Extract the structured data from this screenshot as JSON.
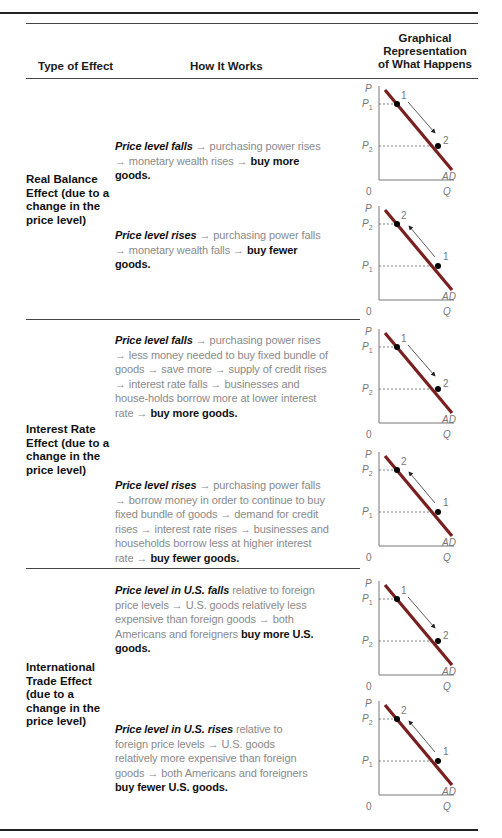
{
  "table": {
    "headers": {
      "type_of_effect": "Type of Effect",
      "how_it_works": "How It Works",
      "graphical_line1": "Graphical",
      "graphical_line2": "Representation",
      "graphical_line3": "of What Happens"
    },
    "rows": [
      {
        "effect": "Real Balance Effect (due to a change in the price level)",
        "cases": [
          {
            "lead": "Price level falls",
            "body": " → purchasing power rises → monetary wealth rises → ",
            "result": "buy more goods.",
            "direction": "down",
            "graph": {
              "y_axis": "P",
              "x_axis": "Q",
              "origin": "0",
              "curve": "AD",
              "upper_price": "P1",
              "lower_price": "P2",
              "start_point": "1",
              "end_point": "2"
            }
          },
          {
            "lead": "Price level rises",
            "body": " → purchasing power falls → monetary wealth falls → ",
            "result": "buy fewer goods.",
            "direction": "up",
            "graph": {
              "y_axis": "P",
              "x_axis": "Q",
              "origin": "0",
              "curve": "AD",
              "upper_price": "P2",
              "lower_price": "P1",
              "start_point": "1",
              "end_point": "2"
            }
          }
        ]
      },
      {
        "effect": "Interest Rate Effect (due to a change in the price level)",
        "cases": [
          {
            "lead": "Price level falls",
            "body": " → purchasing power rises → less money needed to buy fixed bundle of goods → save more → supply of credit rises → interest rate falls → businesses and house-holds borrow more at lower interest rate → ",
            "result": "buy more goods.",
            "direction": "down",
            "graph": {
              "y_axis": "P",
              "x_axis": "Q",
              "origin": "0",
              "curve": "AD",
              "upper_price": "P1",
              "lower_price": "P2",
              "start_point": "1",
              "end_point": "2"
            }
          },
          {
            "lead": "Price level rises",
            "body": " → purchasing power falls → borrow money in order to continue to buy fixed bundle of goods → demand for credit rises → interest rate rises → businesses and households borrow less at higher interest rate → ",
            "result": "buy fewer goods.",
            "direction": "up",
            "graph": {
              "y_axis": "P",
              "x_axis": "Q",
              "origin": "0",
              "curve": "AD",
              "upper_price": "P2",
              "lower_price": "P1",
              "start_point": "1",
              "end_point": "2"
            }
          }
        ]
      },
      {
        "effect": "International Trade Effect (due to a change in the price level)",
        "cases": [
          {
            "lead": "Price level in U.S. falls",
            "body": " relative to foreign price levels → U.S. goods relatively less expensive than foreign goods → both Americans and foreigners ",
            "result": "buy more U.S. goods.",
            "direction": "down",
            "graph": {
              "y_axis": "P",
              "x_axis": "Q",
              "origin": "0",
              "curve": "AD",
              "upper_price": "P1",
              "lower_price": "P2",
              "start_point": "1",
              "end_point": "2"
            }
          },
          {
            "lead": "Price level in U.S. rises",
            "body": " relative to foreign price levels → U.S. goods relatively more expensive than foreign goods → both Americans and foreigners ",
            "result": "buy fewer U.S. goods.",
            "direction": "up",
            "graph": {
              "y_axis": "P",
              "x_axis": "Q",
              "origin": "0",
              "curve": "AD",
              "upper_price": "P2",
              "lower_price": "P1",
              "start_point": "1",
              "end_point": "2"
            }
          }
        ]
      }
    ]
  },
  "colors": {
    "curve": "#7a1f1f",
    "body_text": "#8a8a8a",
    "emphasis_text": "#111111",
    "rule": "#222222"
  }
}
